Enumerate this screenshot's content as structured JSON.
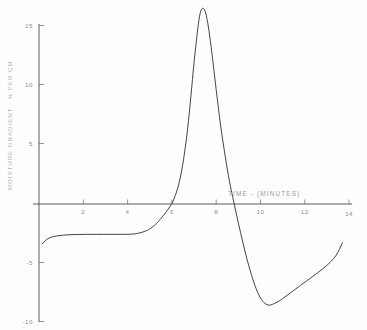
{
  "chart_data": {
    "type": "line",
    "title": "",
    "xlabel": "TIME - (MINUTES)",
    "ylabel": "MOISTURE GRADIENT - % PER CM",
    "xlim": [
      0,
      14
    ],
    "ylim": [
      -10,
      16.5
    ],
    "grid": false,
    "legend": null,
    "x_ticks": [
      2,
      4,
      6,
      8,
      10,
      12,
      14
    ],
    "x_tick_labels": [
      "2",
      "4",
      "6",
      "8",
      "10",
      "12",
      "14"
    ],
    "y_ticks": [
      15,
      10,
      5,
      -5,
      -10
    ],
    "y_tick_labels": [
      "15",
      "10",
      "5",
      "-5",
      "-10"
    ],
    "series": [
      {
        "name": "moisture gradient",
        "color": "#3a3a3a",
        "x": [
          0.15,
          0.3,
          0.5,
          0.7,
          0.9,
          1.1,
          1.4,
          1.8,
          2.2,
          2.6,
          3.0,
          3.4,
          3.8,
          4.2,
          4.5,
          4.8,
          5.0,
          5.2,
          5.4,
          5.6,
          5.8,
          6.0,
          6.15,
          6.3,
          6.45,
          6.6,
          6.75,
          6.9,
          7.0,
          7.1,
          7.2,
          7.3,
          7.4,
          7.5,
          7.6,
          7.7,
          7.85,
          8.0,
          8.2,
          8.4,
          8.6,
          8.8,
          9.0,
          9.2,
          9.4,
          9.6,
          9.8,
          10.0,
          10.2,
          10.4,
          10.7,
          11.0,
          11.4,
          11.8,
          12.2,
          12.6,
          13.0,
          13.4,
          13.7
        ],
        "y": [
          -3.35,
          -3.05,
          -2.82,
          -2.72,
          -2.66,
          -2.62,
          -2.58,
          -2.56,
          -2.55,
          -2.55,
          -2.55,
          -2.55,
          -2.55,
          -2.53,
          -2.45,
          -2.28,
          -2.1,
          -1.82,
          -1.45,
          -1.0,
          -0.52,
          0.05,
          0.7,
          1.6,
          2.9,
          4.7,
          7.0,
          9.9,
          11.9,
          13.6,
          15.2,
          16.2,
          16.45,
          16.2,
          15.4,
          14.2,
          12.0,
          9.6,
          6.6,
          4.1,
          1.9,
          0.1,
          -1.6,
          -3.2,
          -4.7,
          -6.0,
          -7.1,
          -7.9,
          -8.35,
          -8.5,
          -8.3,
          -7.95,
          -7.4,
          -6.85,
          -6.3,
          -5.75,
          -5.15,
          -4.35,
          -3.25
        ]
      }
    ],
    "annotations": [
      {
        "text": "zero crossing rising",
        "x": 6.0,
        "y": 0
      },
      {
        "text": "peak",
        "x": 7.4,
        "y": 16.45
      },
      {
        "text": "zero crossing falling",
        "x": 8.62,
        "y": 0
      },
      {
        "text": "trough",
        "x": 10.35,
        "y": -8.5
      }
    ]
  },
  "axes": {
    "x_axis_title": "TIME - (MINUTES)",
    "y_axis_title": "MOISTURE GRADIENT - % PER CM"
  },
  "colors": {
    "curve": "#3a3a3a",
    "axis": "#4a4a4a",
    "tick_label": "#8d8d8d",
    "axis_title": "#9a9a9a",
    "background": "#fefefe"
  }
}
